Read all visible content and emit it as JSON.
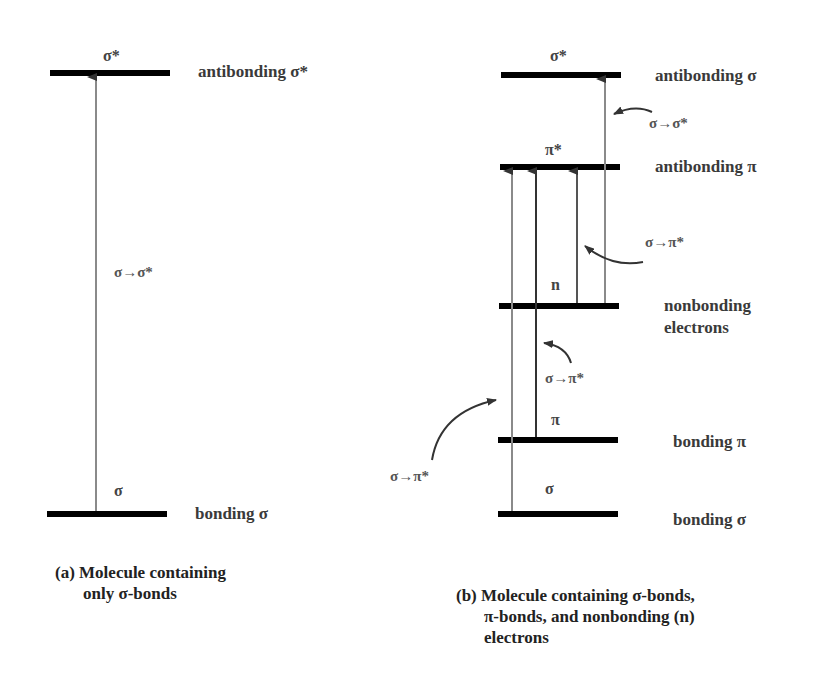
{
  "panel_a": {
    "levels": {
      "antibonding_sigma": {
        "symbol": "σ*",
        "label": "antibonding σ*"
      },
      "bonding_sigma": {
        "symbol": "σ",
        "label": "bonding σ"
      }
    },
    "transitions": [
      {
        "label": "σ→σ*"
      }
    ],
    "caption": {
      "line1": "(a) Molecule containing",
      "line2": "only σ-bonds"
    }
  },
  "panel_b": {
    "levels": {
      "antibonding_sigma": {
        "symbol": "σ*",
        "label": "antibonding σ"
      },
      "antibonding_pi": {
        "symbol": "π*",
        "label": "antibonding π"
      },
      "nonbonding": {
        "symbol": "n",
        "label_line1": "nonbonding",
        "label_line2": "electrons"
      },
      "bonding_pi": {
        "symbol": "π",
        "label": "bonding π"
      },
      "bonding_sigma": {
        "symbol": "σ",
        "label": "bonding σ"
      }
    },
    "transitions": [
      {
        "label": "σ→σ*"
      },
      {
        "label": "σ→π*"
      },
      {
        "label": "σ→π*"
      },
      {
        "label": "σ→π*"
      }
    ],
    "caption": {
      "line1": "(b) Molecule containing σ-bonds,",
      "line2": "π-bonds, and nonbonding (n)",
      "line3": "electrons"
    }
  },
  "colors": {
    "level_line": "#000000",
    "arrow": "#7a7a7a",
    "arrow_dark": "#333333",
    "text": "#3a3a3a"
  }
}
